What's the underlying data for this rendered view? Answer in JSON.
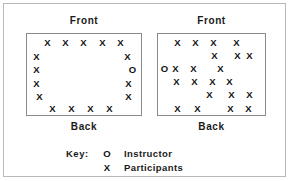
{
  "figure": {
    "width": 291,
    "height": 181,
    "frame_color": "#b9b9b9",
    "box_border_color": "#8a8a8a",
    "mark_color": "#111111",
    "background": "#ffffff"
  },
  "diagrams": [
    {
      "id": "circle-arrangement",
      "name": "left-room",
      "front_label": "Front",
      "back_label": "Back",
      "seats": [
        {
          "symbol": "X",
          "role": "participant",
          "x": 16,
          "y": 4
        },
        {
          "symbol": "X",
          "role": "participant",
          "x": 34,
          "y": 4
        },
        {
          "symbol": "X",
          "role": "participant",
          "x": 52,
          "y": 4
        },
        {
          "symbol": "X",
          "role": "participant",
          "x": 71,
          "y": 4
        },
        {
          "symbol": "X",
          "role": "participant",
          "x": 89,
          "y": 4
        },
        {
          "symbol": "X",
          "role": "participant",
          "x": 5,
          "y": 18
        },
        {
          "symbol": "X",
          "role": "participant",
          "x": 96,
          "y": 18
        },
        {
          "symbol": "X",
          "role": "participant",
          "x": 5,
          "y": 31
        },
        {
          "symbol": "O",
          "role": "instructor",
          "x": 101,
          "y": 31
        },
        {
          "symbol": "X",
          "role": "participant",
          "x": 5,
          "y": 45
        },
        {
          "symbol": "X",
          "role": "participant",
          "x": 97,
          "y": 45
        },
        {
          "symbol": "X",
          "role": "participant",
          "x": 8,
          "y": 58
        },
        {
          "symbol": "X",
          "role": "participant",
          "x": 97,
          "y": 58
        },
        {
          "symbol": "X",
          "role": "participant",
          "x": 21,
          "y": 70
        },
        {
          "symbol": "X",
          "role": "participant",
          "x": 40,
          "y": 70
        },
        {
          "symbol": "X",
          "role": "participant",
          "x": 59,
          "y": 70
        },
        {
          "symbol": "X",
          "role": "participant",
          "x": 78,
          "y": 70
        }
      ]
    },
    {
      "id": "cluster-arrangement",
      "name": "right-room",
      "front_label": "Front",
      "back_label": "Back",
      "seats": [
        {
          "symbol": "X",
          "role": "participant",
          "x": 15,
          "y": 4
        },
        {
          "symbol": "X",
          "role": "participant",
          "x": 33,
          "y": 4
        },
        {
          "symbol": "X",
          "role": "participant",
          "x": 51,
          "y": 4
        },
        {
          "symbol": "X",
          "role": "participant",
          "x": 74,
          "y": 4
        },
        {
          "symbol": "X",
          "role": "participant",
          "x": 52,
          "y": 17
        },
        {
          "symbol": "X",
          "role": "participant",
          "x": 75,
          "y": 17
        },
        {
          "symbol": "X",
          "role": "participant",
          "x": 87,
          "y": 17
        },
        {
          "symbol": "O",
          "role": "instructor",
          "x": 2,
          "y": 30
        },
        {
          "symbol": "X",
          "role": "participant",
          "x": 13,
          "y": 30
        },
        {
          "symbol": "X",
          "role": "participant",
          "x": 31,
          "y": 30
        },
        {
          "symbol": "X",
          "role": "participant",
          "x": 58,
          "y": 30
        },
        {
          "symbol": "X",
          "role": "participant",
          "x": 14,
          "y": 43
        },
        {
          "symbol": "X",
          "role": "participant",
          "x": 32,
          "y": 43
        },
        {
          "symbol": "X",
          "role": "participant",
          "x": 50,
          "y": 43
        },
        {
          "symbol": "X",
          "role": "participant",
          "x": 67,
          "y": 43
        },
        {
          "symbol": "X",
          "role": "participant",
          "x": 47,
          "y": 56
        },
        {
          "symbol": "X",
          "role": "participant",
          "x": 69,
          "y": 56
        },
        {
          "symbol": "X",
          "role": "participant",
          "x": 87,
          "y": 56
        },
        {
          "symbol": "X",
          "role": "participant",
          "x": 15,
          "y": 70
        },
        {
          "symbol": "X",
          "role": "participant",
          "x": 35,
          "y": 70
        },
        {
          "symbol": "X",
          "role": "participant",
          "x": 68,
          "y": 70
        },
        {
          "symbol": "X",
          "role": "participant",
          "x": 86,
          "y": 70
        }
      ]
    }
  ],
  "key": {
    "title": "Key:",
    "entries": [
      {
        "symbol": "O",
        "label": "Instructor"
      },
      {
        "symbol": "X",
        "label": "Participants"
      }
    ]
  }
}
